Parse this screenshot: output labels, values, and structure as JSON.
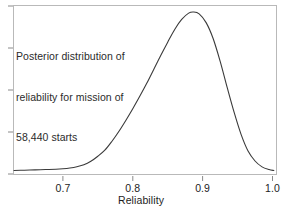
{
  "chart_data": {
    "type": "line",
    "title": "",
    "subtitle": "",
    "xlabel": "Reliability",
    "ylabel": "",
    "xlim": [
      0.63,
      1.005
    ],
    "ylim": [
      0,
      1.06
    ],
    "grid": false,
    "legend": null,
    "xticks": [
      0.7,
      0.8,
      0.9,
      1.0
    ],
    "xticklabels": [
      "0.7",
      "0.8",
      "0.9",
      "1.0"
    ],
    "yticks": [
      0.0,
      0.25,
      0.5,
      0.75,
      1.0
    ],
    "yticklabels": [
      "",
      "",
      "",
      "",
      ""
    ],
    "annotations": [
      {
        "text": "Posterior distribution of reliability for mission of 58,440 starts",
        "lines": [
          "Posterior distribution of",
          "reliability for mission of",
          "58,440 starts"
        ],
        "x": 0.655,
        "y": 0.93
      }
    ],
    "series": [
      {
        "name": "posterior density",
        "color": "#3a3a3a",
        "linewidth": 1.1,
        "x": [
          0.63,
          0.645,
          0.66,
          0.675,
          0.69,
          0.7,
          0.71,
          0.72,
          0.73,
          0.74,
          0.75,
          0.76,
          0.77,
          0.78,
          0.79,
          0.8,
          0.81,
          0.82,
          0.83,
          0.84,
          0.85,
          0.86,
          0.87,
          0.88,
          0.887,
          0.895,
          0.905,
          0.915,
          0.925,
          0.935,
          0.945,
          0.955,
          0.965,
          0.975,
          0.985,
          0.995,
          1.002
        ],
        "y": [
          0.022,
          0.024,
          0.026,
          0.028,
          0.03,
          0.033,
          0.038,
          0.046,
          0.058,
          0.08,
          0.112,
          0.15,
          0.205,
          0.268,
          0.338,
          0.412,
          0.49,
          0.572,
          0.66,
          0.748,
          0.832,
          0.912,
          0.975,
          1.015,
          1.022,
          1.01,
          0.955,
          0.855,
          0.712,
          0.548,
          0.39,
          0.25,
          0.145,
          0.082,
          0.045,
          0.028,
          0.022
        ]
      }
    ],
    "peak": {
      "x": 0.887,
      "y": 1.022
    }
  },
  "axes": {
    "xaxis_title": "Reliability",
    "xtick_labels": [
      "0.7",
      "0.8",
      "0.9",
      "1.0"
    ]
  },
  "annotation": {
    "line1": "Posterior distribution of",
    "line2": "reliability for mission of",
    "line3": "58,440 starts"
  },
  "colors": {
    "curve": "#3a3a3a",
    "frame": "#b9b9b9",
    "tick": "#8a8a8a",
    "text": "#1d1d1d"
  }
}
